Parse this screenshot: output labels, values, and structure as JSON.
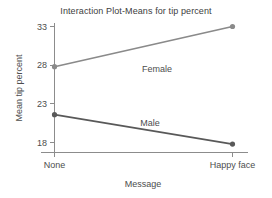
{
  "chart_data": {
    "type": "line",
    "title": "Interaction Plot-Means for tip percent",
    "xlabel": "Message",
    "ylabel": "Mean tip percent",
    "categories": [
      "None",
      "Happy face"
    ],
    "series": [
      {
        "name": "Female",
        "values": [
          27.8,
          33.0
        ],
        "color": "#8a8a8a"
      },
      {
        "name": "Male",
        "values": [
          21.6,
          17.8
        ],
        "color": "#595959"
      }
    ],
    "yticks": [
      18,
      23,
      28,
      33
    ],
    "ylim": [
      16.5,
      34.2
    ],
    "grid": false,
    "legend": "inline-labels",
    "markers": "circle"
  },
  "axis": {
    "ytick_labels": [
      "33",
      "28",
      "23",
      "18"
    ],
    "xtick_labels": [
      "None",
      "Happy face"
    ]
  },
  "labels": {
    "female": "Female",
    "male": "Male"
  }
}
